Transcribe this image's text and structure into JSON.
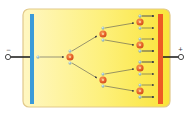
{
  "diagram": {
    "type": "electron-avalanche-cascade",
    "chamber": {
      "x": 23,
      "y": 9,
      "width": 147,
      "height": 98,
      "fill_left": "#fdf6b0",
      "fill_right": "#fbe94a",
      "border": "#d9c27a"
    },
    "cathode": {
      "label": "−",
      "color": "#3a9ad9",
      "x": 30,
      "y": 14,
      "width": 4,
      "height": 90
    },
    "anode": {
      "label": "+",
      "color": "#ee5a24",
      "x": 158,
      "y": 14,
      "width": 5,
      "height": 90
    },
    "colors": {
      "ion": "#e8632a",
      "ion_core": "#f4a460",
      "electron": "#7fa7b8",
      "arrow": "#444444",
      "wire": "#222222"
    },
    "ions": [
      {
        "id": "g1",
        "x": 70,
        "y": 57
      },
      {
        "id": "g2a",
        "x": 103,
        "y": 34
      },
      {
        "id": "g2b",
        "x": 103,
        "y": 80
      },
      {
        "id": "g3a",
        "x": 140,
        "y": 22
      },
      {
        "id": "g3b",
        "x": 140,
        "y": 45
      },
      {
        "id": "g3c",
        "x": 140,
        "y": 68
      },
      {
        "id": "g3d",
        "x": 140,
        "y": 91
      }
    ]
  },
  "labels": {
    "cathode_sign": "−",
    "anode_sign": "+"
  }
}
